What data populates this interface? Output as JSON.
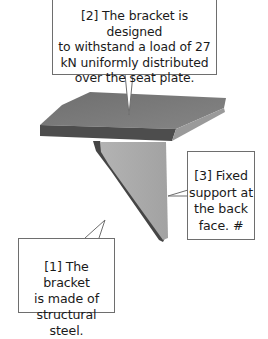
{
  "figure": {
    "colors": {
      "seat_top": "#777777",
      "seat_front": "#4d4d4d",
      "seat_edge_light": "#9a9a9a",
      "web_face": "#a9a9a9",
      "web_edge_dark": "#454545",
      "callout_border": "#6e6e6e",
      "background": "#ffffff"
    }
  },
  "callouts": [
    {
      "id": "1",
      "lines": [
        "[1] The bracket",
        "is made of",
        "structural steel."
      ]
    },
    {
      "id": "2",
      "lines": [
        "[2] The bracket is designed",
        "to withstand a load of 27",
        "kN uniformly distributed",
        "over the seat plate."
      ]
    },
    {
      "id": "3",
      "lines": [
        "[3] Fixed",
        "support at",
        "the back",
        "face.  #"
      ]
    }
  ]
}
